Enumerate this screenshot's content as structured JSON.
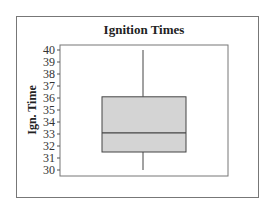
{
  "chart_data": {
    "type": "box",
    "title": "Ignition Times",
    "xlabel": "",
    "ylabel": "Ign. Time",
    "ylim": [
      29.6,
      40.4
    ],
    "yticks": [
      30,
      31,
      32,
      33,
      34,
      35,
      36,
      37,
      38,
      39,
      40
    ],
    "grid": false,
    "legend": null,
    "series": [
      {
        "name": "Ign. Time",
        "min": 30.0,
        "q1": 31.5,
        "median": 33.1,
        "q3": 36.1,
        "max": 40.0
      }
    ],
    "colors": {
      "box_fill": "#d4d4d4",
      "line": "#444444",
      "frame": "#777777"
    }
  }
}
